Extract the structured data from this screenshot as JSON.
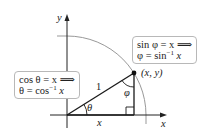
{
  "diagram": {
    "type": "unit-circle-inverse-trig",
    "colors": {
      "axes": "#222222",
      "triangle": "#1a1a1a",
      "arc": "#999999",
      "box_border": "#b8b8b8",
      "text": "#222222"
    },
    "axes": {
      "x_label": "x",
      "y_label": "y"
    },
    "point": {
      "label": "(x, y)"
    },
    "hypotenuse_label": "1",
    "base_label": "x",
    "angles": {
      "theta": "θ",
      "phi": "φ"
    },
    "cos_box": {
      "line1": "cos θ = x ⟹",
      "line2_prefix": "θ = cos",
      "line2_sup": "−1",
      "line2_suffix": " x"
    },
    "sin_box": {
      "line1": "sin φ = x ⟹",
      "line2_prefix": "φ = sin",
      "line2_sup": "−1",
      "line2_suffix": " x"
    }
  }
}
